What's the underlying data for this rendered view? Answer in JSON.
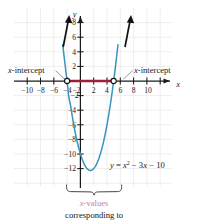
{
  "chart_data": {
    "type": "line",
    "title": "",
    "equation_label": "y = x² − 3x − 10",
    "function": "y = x^2 - 3x - 10",
    "xlabel": "x",
    "ylabel": "y",
    "xlim": [
      -12,
      12
    ],
    "ylim": [
      -14,
      10
    ],
    "grid": true,
    "x_ticks": [
      -10,
      -8,
      -6,
      -4,
      -2,
      2,
      4,
      6,
      8,
      10
    ],
    "x_tick_labels": [
      "−10",
      "−8",
      "−6",
      "−4",
      "−2",
      "2",
      "4",
      "6",
      "8",
      "10"
    ],
    "y_ticks": [
      -12,
      -10,
      -8,
      -6,
      -4,
      -2,
      2,
      4,
      6,
      8
    ],
    "y_tick_labels": [
      "−12",
      "−10",
      "−8",
      "−6",
      "−4",
      "−2",
      "2",
      "4",
      "6",
      "8"
    ],
    "curve_color": "#3a93bd",
    "highlight_color": "#9c1f3c",
    "arrow_color": "#111111",
    "grid_color": "#e4e4e4",
    "axis_color": "#1a1a1a",
    "roots": [
      -2,
      5
    ],
    "vertex": [
      1.5,
      -12.25
    ],
    "y_intercept": -10,
    "points": [
      {
        "x": -2,
        "y": 0,
        "label": "x-intercept",
        "marker": "open-circle"
      },
      {
        "x": 5,
        "y": 0,
        "label": "x-intercept",
        "marker": "open-circle"
      }
    ],
    "highlight_segment": {
      "from": -2,
      "to": 5,
      "y": 0,
      "description": "x-values between the intercepts"
    },
    "series": [
      {
        "name": "y = x^2 - 3x - 10",
        "x": [
          -2.65,
          -2.4,
          -2.2,
          -2.0,
          -1.75,
          -1.5,
          -1.25,
          -1.0,
          -0.75,
          -0.5,
          -0.25,
          0,
          0.25,
          0.5,
          0.75,
          1.0,
          1.25,
          1.5,
          1.75,
          2.0,
          2.25,
          2.5,
          2.75,
          3.0,
          3.25,
          3.5,
          3.75,
          4.0,
          4.25,
          4.5,
          4.75,
          5.0,
          5.25,
          5.5,
          5.65
        ],
        "y": [
          4.97,
          2.96,
          1.44,
          0.0,
          -2.19,
          -3.25,
          -4.69,
          -6.0,
          -7.19,
          -8.25,
          -9.19,
          -10.0,
          -10.69,
          -11.25,
          -11.69,
          -12.0,
          -12.19,
          -12.25,
          -12.19,
          -12.0,
          -11.69,
          -11.25,
          -10.69,
          -10.0,
          -9.19,
          -8.25,
          -7.19,
          -6.0,
          -4.69,
          -3.25,
          -1.69,
          0.0,
          1.81,
          3.75,
          4.97
        ]
      }
    ]
  },
  "annotations": {
    "left_intercept": {
      "italic_part": "x",
      "rest": "-intercept"
    },
    "right_intercept": {
      "italic_part": "x",
      "rest": "-intercept"
    }
  },
  "caption": {
    "line1_italic": "x",
    "line1_rest": "-values",
    "line2": "corresponding to"
  }
}
